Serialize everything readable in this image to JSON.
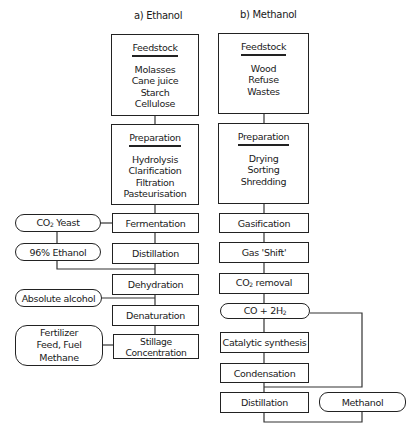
{
  "diagram": {
    "ethanol": {
      "title": "a) Ethanol",
      "feedstock": {
        "heading": "Feedstock",
        "items": [
          "Molasses",
          "Cane juice",
          "Starch",
          "Cellulose"
        ]
      },
      "preparation": {
        "heading": "Preparation",
        "items": [
          "Hydrolysis",
          "Clarification",
          "Filtration",
          "Pasteurisation"
        ]
      },
      "steps": [
        "Fermentation",
        "Distillation",
        "Dehydration",
        "Denaturation",
        "Stillage Concentration"
      ],
      "outputs": {
        "co2_yeast": {
          "main": "CO",
          "sub": "2",
          "rest": " Yeast"
        },
        "ethanol96": "96% Ethanol",
        "absolute": "Absolute alcohol",
        "byproducts": [
          "Fertilizer",
          "Feed, Fuel",
          "Methane"
        ]
      }
    },
    "methanol": {
      "title": "b) Methanol",
      "feedstock": {
        "heading": "Feedstock",
        "items": [
          "Wood",
          "Refuse",
          "Wastes"
        ]
      },
      "preparation": {
        "heading": "Preparation",
        "items": [
          "Drying",
          "Sorting",
          "Shredding"
        ]
      },
      "steps": {
        "gasification": "Gasification",
        "shift": "Gas 'Shift'",
        "co2_removal": {
          "main": "CO",
          "sub": "2",
          "rest": " removal"
        },
        "syngas": {
          "main": "CO + 2H",
          "sub": "2"
        },
        "catalytic": "Catalytic synthesis",
        "condensation": "Condensation",
        "distillation": "Distillation"
      },
      "product": "Methanol"
    }
  }
}
